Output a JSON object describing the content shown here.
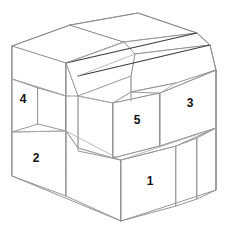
{
  "figure": {
    "background_color": "#ffffff",
    "line_color": "#8a8a8a",
    "accent_line_color": "#3a3a3a",
    "label_color": "#111111"
  },
  "labels": [
    {
      "id": "block-1",
      "text": "1",
      "x": 150,
      "y": 182
    },
    {
      "id": "block-2",
      "text": "2",
      "x": 36,
      "y": 159
    },
    {
      "id": "block-3",
      "text": "3",
      "x": 190,
      "y": 104
    },
    {
      "id": "block-4",
      "text": "4",
      "x": 23,
      "y": 100
    },
    {
      "id": "block-5",
      "text": "5",
      "x": 137,
      "y": 121
    }
  ],
  "geometry": {
    "projection": "isometric",
    "visible_block_count": 5,
    "left_face_polygon": "12,46 12,176 121,221 121,160 38,131 38,76",
    "right_face_polygon": "121,160 121,221 216,190 216,70 131,101 131,128",
    "top_face_polygon": "12,46 71,25 131,43 131,101 216,70 197,33 138,13 38,41",
    "block5_front": "113,103 113,158 160,146 160,93",
    "block5_top": "113,103 131,92 176,83 160,93"
  }
}
